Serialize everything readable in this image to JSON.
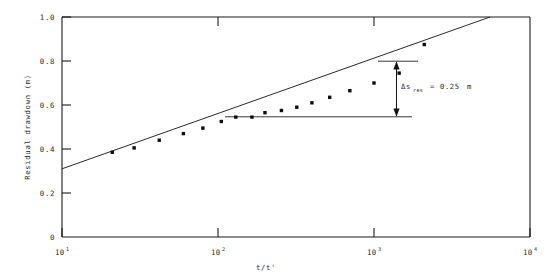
{
  "figure": {
    "background_color": "#ffffff",
    "ink_color": "#111111"
  },
  "chart_data": {
    "type": "scatter",
    "title": "",
    "subtitle": "",
    "xlabel": "t/t'",
    "ylabel": "Residual drawdown (m)",
    "xscale": "log",
    "yscale": "linear",
    "xlim": [
      10,
      10000
    ],
    "ylim": [
      0,
      1.0
    ],
    "grid": false,
    "legend": null,
    "x_tick_labels": [
      "10",
      "10",
      "10",
      "10"
    ],
    "x_tick_exponents": [
      "1",
      "2",
      "3",
      "4"
    ],
    "x_tick_values": [
      10,
      100,
      1000,
      10000
    ],
    "y_tick_labels": [
      "0",
      "0.2",
      "0.4",
      "0.6",
      "0.8",
      "1.0"
    ],
    "y_tick_values": [
      0,
      0.2,
      0.4,
      0.6,
      0.8,
      1.0
    ],
    "series": [
      {
        "name": "Residual drawdown measurements",
        "marker": "filled-square",
        "x": [
          21,
          29,
          42,
          60,
          80,
          105,
          130,
          165,
          200,
          255,
          320,
          400,
          520,
          700,
          1000,
          1450,
          2100
        ],
        "y": [
          0.385,
          0.405,
          0.44,
          0.47,
          0.495,
          0.525,
          0.545,
          0.545,
          0.565,
          0.575,
          0.59,
          0.61,
          0.635,
          0.665,
          0.7,
          0.745,
          0.875
        ]
      }
    ],
    "fit_line": {
      "name": "Straight-line semilog fit",
      "x": [
        10,
        7600
      ],
      "y": [
        0.31,
        1.0
      ],
      "slope_per_log_cycle": 0.25
    },
    "annotations": [
      {
        "name": "delta-s-res",
        "symbol": "Δs",
        "subscript": "res",
        "equals": "=",
        "value": "0.25",
        "unit": "m",
        "text": "Δs res = 0.25 m",
        "arrow": {
          "x": 1010,
          "y_top": 0.845,
          "y_bottom": 0.595,
          "double_headed": true
        },
        "guide_lines": [
          {
            "name": "upper-guide",
            "x_start": 760,
            "x_end": 1450,
            "y": 0.845
          },
          {
            "name": "lower-guide",
            "x_start": 118,
            "x_end": 1270,
            "y": 0.595
          }
        ]
      }
    ]
  }
}
